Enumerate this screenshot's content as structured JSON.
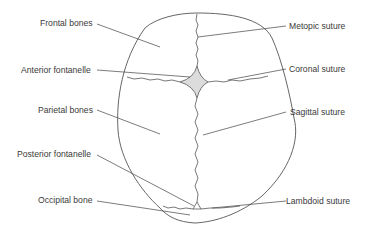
{
  "diagram": {
    "colors": {
      "outline": "#555555",
      "suture": "#555555",
      "leader": "#444444",
      "fontanelle_fill": "#dcdcdc",
      "text": "#3a3a3a"
    },
    "labels_left": [
      {
        "id": "frontal-bones",
        "text": "Frontal bones"
      },
      {
        "id": "anterior-fontanelle",
        "text": "Anterior fontanelle"
      },
      {
        "id": "parietal-bones",
        "text": "Parietal bones"
      },
      {
        "id": "posterior-fontanelle",
        "text": "Posterior fontanelle"
      },
      {
        "id": "occipital-bone",
        "text": "Occipital bone"
      }
    ],
    "labels_right": [
      {
        "id": "metopic-suture",
        "text": "Metopic suture"
      },
      {
        "id": "coronal-suture",
        "text": "Coronal suture"
      },
      {
        "id": "sagittal-suture",
        "text": "Sagittal suture"
      },
      {
        "id": "lambdoid-suture",
        "text": "Lambdoid suture"
      }
    ]
  }
}
